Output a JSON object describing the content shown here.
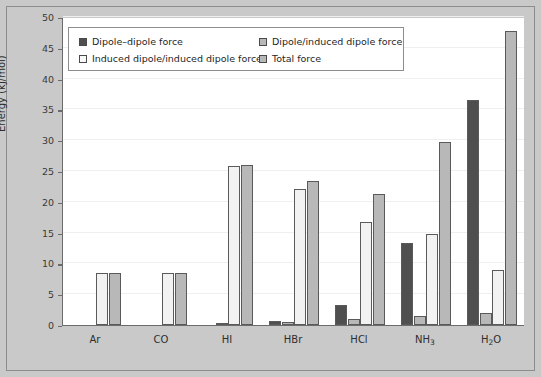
{
  "chart_data": {
    "type": "bar",
    "title": "",
    "xlabel": "",
    "ylabel": "Energy (kJ/mol)",
    "ylim": [
      0,
      50
    ],
    "yticks": [
      0,
      5,
      10,
      15,
      20,
      25,
      30,
      35,
      40,
      45,
      50
    ],
    "grid": true,
    "legend_position": "top-left-inside",
    "categories": [
      "Ar",
      "CO",
      "HI",
      "HBr",
      "HCl",
      "NH3",
      "H2O"
    ],
    "category_labels_html": [
      "Ar",
      "CO",
      "HI",
      "HBr",
      "HCl",
      "NH<sub>3</sub>",
      "H<sub>2</sub>O"
    ],
    "series": [
      {
        "name": "Dipole–dipole force",
        "color": "#4f4f4f",
        "values": [
          0,
          0,
          0,
          0.7,
          3.3,
          13.3,
          36.6
        ]
      },
      {
        "name": "Dipole/induced dipole force",
        "color": "#b8b8b8",
        "values": [
          0,
          0,
          0.2,
          0.5,
          1.0,
          1.5,
          1.9
        ]
      },
      {
        "name": "Induced dipole/induced dipole force",
        "color": "#f2f2f2",
        "values": [
          8.4,
          8.5,
          25.8,
          22.0,
          16.8,
          14.8,
          9.0
        ]
      },
      {
        "name": "Total force",
        "color": "#b8b8b8",
        "values": [
          8.4,
          8.5,
          26.0,
          23.3,
          21.2,
          29.7,
          47.8
        ]
      }
    ]
  },
  "legend": {
    "entries": [
      {
        "label": "Dipole–dipole force",
        "swatch": "#4f4f4f"
      },
      {
        "label": "Dipole/induced dipole force",
        "swatch": "#b8b8b8"
      },
      {
        "label": "Induced dipole/induced dipole force",
        "swatch": "#f8f8f8"
      },
      {
        "label": "Total force",
        "swatch": "#b8b8b8"
      }
    ]
  },
  "colors": {
    "figure_background": "#c9c9c9",
    "plot_background": "#ffffff",
    "axis": "#6b6b6b",
    "gridline": "#efefef",
    "bar_outline": "#5a5a5a",
    "text": "#2e2e2e"
  }
}
